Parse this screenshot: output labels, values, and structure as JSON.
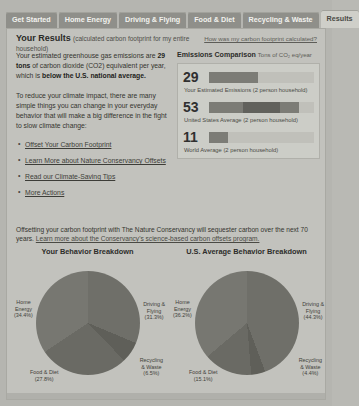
{
  "tabs": [
    {
      "label": "Get Started",
      "active": false
    },
    {
      "label": "Home Energy",
      "active": false
    },
    {
      "label": "Driving & Flying",
      "active": false
    },
    {
      "label": "Food & Diet",
      "active": false
    },
    {
      "label": "Recycling & Waste",
      "active": false
    },
    {
      "label": "Results",
      "active": true
    }
  ],
  "header": {
    "title": "Your Results",
    "subtitle": "(calculated carbon footprint for my entire household)",
    "calc_link": "How was my carbon footprint calculated?"
  },
  "summary": {
    "para1_a": "Your estimated greenhouse gas emissions are ",
    "para1_b": "29 tons",
    "para1_c": " of carbon dioxide (CO2) equivalent per year, which is ",
    "para1_d": "below the U.S. national average.",
    "para2": "To reduce your climate impact, there are many simple things you can change in your everyday behavior that will make a big difference in the fight to slow climate change:",
    "links": [
      "Offset Your Carbon Footprint",
      "Learn More about Nature Conservancy Offsets",
      "Read our Climate-Saving Tips",
      "More Actions"
    ]
  },
  "comparison": {
    "title": "Emissions Comparison",
    "unit": "Tons of CO₂ eq/year",
    "max": 62,
    "rows": [
      {
        "value": "29",
        "number": 29,
        "label": "Your Estimated Emissions (2 person household)",
        "segment_start_pct": 0,
        "segment_end_pct": 0
      },
      {
        "value": "53",
        "number": 53,
        "label": "United States Average (2 person household)",
        "segment_start_pct": 32,
        "segment_end_pct": 68
      },
      {
        "value": "11",
        "number": 11,
        "label": "World Average (2 person household)",
        "segment_start_pct": 0,
        "segment_end_pct": 0
      }
    ]
  },
  "offset_note": {
    "text": "Offsetting your carbon footprint with The Nature Conservancy will sequester carbon over the next 70 years. ",
    "link": "Learn more about the Conservancy's science-based carbon offsets program."
  },
  "chart_data": [
    {
      "type": "pie",
      "title": "Your Behavior Breakdown",
      "categories": [
        "Driving & Flying",
        "Recycling & Waste",
        "Food & Diet",
        "Home Energy"
      ],
      "values": [
        31.3,
        6.5,
        27.8,
        34.4
      ],
      "labels": [
        "Driving &\nFlying\n(31.3%)",
        "Recycling\n& Waste\n(6.5%)",
        "Food & Diet\n(27.8%)",
        "Home\nEnergy\n(34.4%)"
      ],
      "colors": [
        "#6f6f69",
        "#5f5f59",
        "#6a6a64",
        "#777771"
      ],
      "legend": "labels-outside"
    },
    {
      "type": "pie",
      "title": "U.S. Average Behavior Breakdown",
      "categories": [
        "Driving & Flying",
        "Recycling & Waste",
        "Food & Diet",
        "Home Energy"
      ],
      "values": [
        44.3,
        4.4,
        15.1,
        36.2
      ],
      "labels": [
        "Driving &\nFlying\n(44.3%)",
        "Recycling\n& Waste\n(4.4%)",
        "Food & Diet\n(15.1%)",
        "Home\nEnergy\n(36.2%)"
      ],
      "colors": [
        "#6f6f69",
        "#5f5f59",
        "#6a6a64",
        "#777771"
      ],
      "legend": "labels-outside"
    }
  ]
}
